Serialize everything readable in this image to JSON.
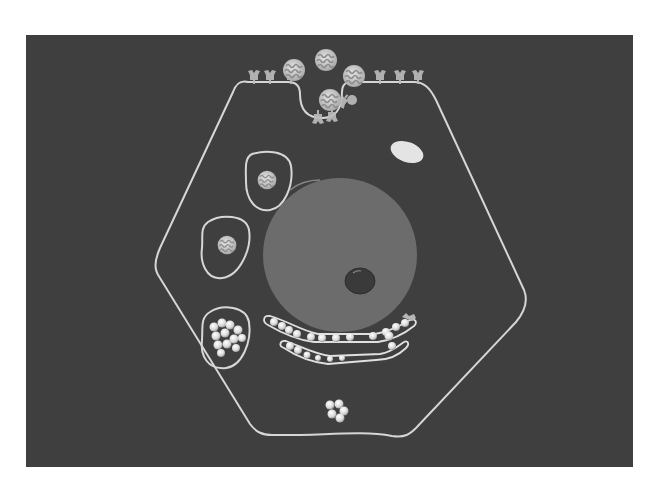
{
  "figure": {
    "title": "",
    "description": "Schematic of a cell showing receptor-mediated endocytosis: ligands binding surface receptors, a coated pit, endocytic vesicles, a lysosome, nucleus with nucleolus, and endoplasmic reticulum/Golgi with particles",
    "colors": {
      "background": "#3f3f3f",
      "membrane": "#d8d8d8",
      "nucleus": "#6e6e6e",
      "nucleolus": "#3a3a3a",
      "particle": "#e8e8e8",
      "ligand": "#cfcfcf",
      "receptor": "#bdbdbd"
    }
  },
  "elements": {
    "ligands_outside": 3,
    "ligand_in_pit": 1,
    "endosomes_with_ligand": 2,
    "lysosome_particles": 12,
    "er_chains": 2,
    "free_particle_cluster": 5
  }
}
